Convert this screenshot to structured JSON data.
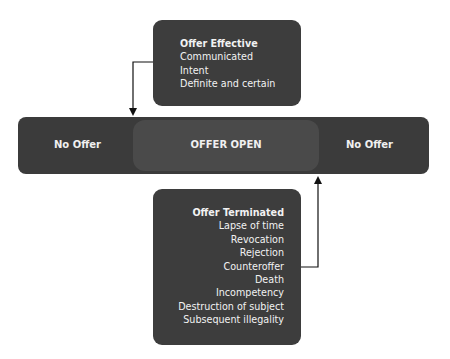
{
  "offer_effective": {
    "title": "Offer Effective",
    "items": [
      "Communicated",
      "Intent",
      "Definite and certain"
    ]
  },
  "timeline": {
    "left": "No Offer",
    "center": "OFFER OPEN",
    "right": "No Offer"
  },
  "offer_terminated": {
    "title": "Offer Terminated",
    "items": [
      "Lapse of time",
      "Revocation",
      "Rejection",
      "Counteroffer",
      "Death",
      "Incompetency",
      "Destruction of subject",
      "Subsequent illegality"
    ]
  },
  "colors": {
    "box": "#3d3d3d",
    "inner": "#4a4a4a",
    "text": "#f2f2f2",
    "arrow": "#111111"
  }
}
